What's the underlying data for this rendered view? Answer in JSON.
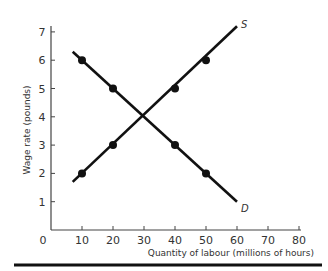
{
  "chart_data": {
    "type": "line",
    "title": "",
    "xlabel": "Quantity of labour (millions of hours)",
    "ylabel": "Wage rate (pounds)",
    "xlim": [
      0,
      80
    ],
    "ylim": [
      0,
      7
    ],
    "x_ticks": [
      "0",
      "10",
      "20",
      "30",
      "40",
      "50",
      "60",
      "70",
      "80"
    ],
    "y_ticks": [
      "1",
      "2",
      "3",
      "4",
      "5",
      "6",
      "7"
    ],
    "grid": false,
    "series": [
      {
        "name": "S",
        "label": "S",
        "line": [
          [
            7,
            1.7
          ],
          [
            60,
            7.2
          ]
        ],
        "points": [
          [
            10,
            2
          ],
          [
            20,
            3
          ],
          [
            40,
            5
          ],
          [
            50,
            6
          ]
        ]
      },
      {
        "name": "D",
        "label": "D",
        "line": [
          [
            7,
            6.3
          ],
          [
            60,
            1
          ]
        ],
        "points": [
          [
            10,
            6
          ],
          [
            20,
            5
          ],
          [
            40,
            3
          ],
          [
            50,
            2
          ]
        ]
      }
    ],
    "equilibrium": [
      30,
      4
    ]
  }
}
